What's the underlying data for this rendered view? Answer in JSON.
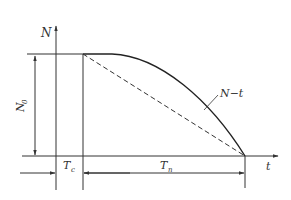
{
  "diagram": {
    "y_axis_label": "N",
    "x_axis_label": "t",
    "curve_label": "N−t",
    "height_dim_label": "N",
    "height_dim_sub": "0",
    "delay_dim_label": "T",
    "delay_dim_sub": "c",
    "duration_dim_label": "T",
    "duration_dim_sub": "n",
    "colors": {
      "line": "#333333",
      "background": "#ffffff"
    }
  }
}
